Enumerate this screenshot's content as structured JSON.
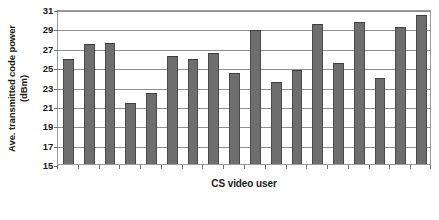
{
  "chart_data": {
    "type": "bar",
    "title": "",
    "xlabel": "CS video user",
    "ylabel_line1": "Ave. transmitted code power",
    "ylabel_line2": "(dBm)",
    "ylim": [
      15,
      31
    ],
    "yticks": [
      15,
      17,
      19,
      21,
      23,
      25,
      27,
      29,
      31
    ],
    "grid": true,
    "legend": "none",
    "bar_color": "#6e6e6e",
    "bar_edge_color": "#4a4a4a",
    "categories": [
      "1",
      "2",
      "3",
      "4",
      "5",
      "6",
      "7",
      "8",
      "9",
      "10",
      "11",
      "12",
      "13",
      "14",
      "15",
      "16"
    ],
    "values": [
      25.8,
      27.4,
      27.5,
      21.3,
      22.3,
      26.1,
      25.8,
      26.5,
      24.4,
      28.8,
      23.5,
      24.7,
      29.5,
      25.4,
      29.7,
      23.9
    ],
    "values_tail": [
      29.1,
      30.4
    ],
    "n_bars": 16
  },
  "axes": {
    "y_title_line1": "Ave. transmitted code power",
    "y_title_line2": "(dBm)",
    "x_title": "CS video user"
  }
}
